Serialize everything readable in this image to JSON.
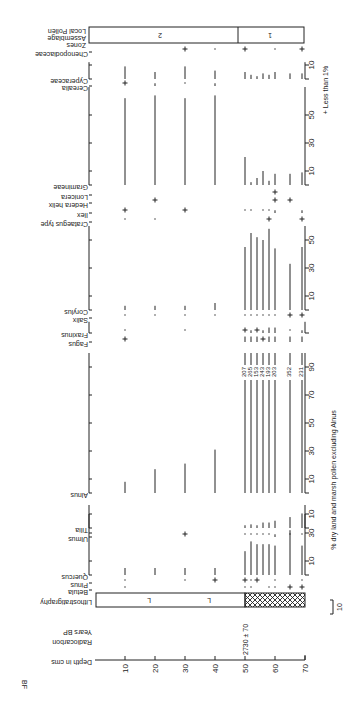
{
  "figure_label": "BF",
  "legend": {
    "plus_note": "+ Less than 1%",
    "scale_bar": "10"
  },
  "x_axis_title": "% dry land and marsh pollen excluding Alnus",
  "depth_axis": {
    "label": "Depth in cms",
    "ticks": [
      10,
      20,
      30,
      40,
      50,
      60,
      70
    ]
  },
  "radiocarbon": {
    "label": "Radiocarbon Years BP",
    "date": "2730 ± 70",
    "depth": 50
  },
  "lithostratigraphy": {
    "label": "Lithostratigraphy",
    "upper_symbol": "L",
    "lower": "hatched"
  },
  "zones": {
    "label": "Local Pollen Assemblage Zones",
    "items": [
      {
        "name": "2",
        "from": 0,
        "to": 50
      },
      {
        "name": "1",
        "from": 50,
        "to": 70
      }
    ]
  },
  "alnus_totals": [
    "207",
    "265",
    "153",
    "243",
    "193",
    "203",
    "352",
    "231"
  ],
  "chart_data": {
    "type": "bar",
    "xlabel": "Depth in cms",
    "ylabel": "% dry land and marsh pollen excluding Alnus",
    "depths": [
      10,
      20,
      30,
      40,
      50,
      52,
      54,
      56,
      58,
      60,
      65,
      69
    ],
    "series": [
      {
        "name": "Betula",
        "values": [
          "·",
          "",
          "",
          "",
          "·",
          "·",
          "",
          "",
          "·",
          "·",
          "+",
          "+"
        ]
      },
      {
        "name": "Pinus",
        "values": [
          "·",
          "",
          "·",
          "+",
          "+",
          "·",
          "+",
          "",
          "",
          "·",
          "",
          "·"
        ]
      },
      {
        "name": "Quercus",
        "values": [
          5,
          5,
          5,
          5,
          17,
          24,
          22,
          22,
          22,
          21,
          32,
          21
        ]
      },
      {
        "name": "Ulmus",
        "values": [
          "",
          "",
          "+",
          "",
          "·",
          "·",
          "·",
          "·",
          "·",
          "1",
          "·",
          "·"
        ]
      },
      {
        "name": "Tilia",
        "values": [
          "",
          "",
          "",
          "",
          "1",
          "2",
          "1",
          "3",
          "3",
          "4",
          "6",
          "8"
        ]
      },
      {
        "name": "Alnus",
        "values": [
          8,
          17,
          21,
          31,
          100,
          100,
          100,
          100,
          100,
          100,
          100,
          100
        ]
      },
      {
        "name": "Fagus",
        "values": [
          "+",
          "",
          "",
          "",
          "3",
          "3",
          "3",
          "+",
          "3",
          "3",
          "3",
          "3"
        ]
      },
      {
        "name": "Fraxinus",
        "values": [
          "·",
          "",
          "·",
          "",
          "+",
          "1",
          "+",
          "1",
          "3",
          "3",
          "·",
          "1"
        ]
      },
      {
        "name": "Salix",
        "values": [
          "·",
          "·",
          "·",
          "·",
          "·",
          "·",
          "·",
          "·",
          "·",
          "·",
          "+",
          "+"
        ]
      },
      {
        "name": "Corylus",
        "values": [
          3,
          3,
          3,
          5,
          45,
          55,
          52,
          50,
          58,
          44,
          33,
          45
        ]
      },
      {
        "name": "Crataegus type",
        "values": [
          "·",
          "·",
          "",
          "",
          "",
          "",
          "",
          "",
          "+",
          "",
          "",
          "+"
        ]
      },
      {
        "name": "Ilex",
        "values": [
          "+",
          "",
          "+",
          "",
          "·",
          "·",
          "",
          "·",
          "·",
          "1",
          "",
          "1"
        ]
      },
      {
        "name": "Hedera helix",
        "values": [
          "",
          "+",
          "",
          "",
          "",
          "",
          "",
          "",
          "",
          "+",
          "+",
          ""
        ]
      },
      {
        "name": "Lonicera",
        "values": [
          "",
          "",
          "",
          "",
          "",
          "",
          "",
          "",
          "",
          "+",
          "",
          ""
        ]
      },
      {
        "name": "Gramineae",
        "values": [
          62,
          64,
          62,
          64,
          20,
          2,
          5,
          10,
          3,
          8,
          8,
          9
        ]
      },
      {
        "name": "Cerealia",
        "values": [
          "+",
          "1",
          "·",
          "1",
          "",
          "",
          "",
          "",
          "",
          "",
          "",
          ""
        ]
      },
      {
        "name": "Cyperaceae",
        "values": [
          9,
          5,
          9,
          6,
          5,
          3,
          2,
          4,
          3,
          5,
          4,
          4
        ]
      },
      {
        "name": "Chenopodiaceae",
        "values": [
          "",
          "",
          "+",
          "·",
          "+",
          "",
          "",
          "",
          "",
          "·",
          "",
          "+"
        ]
      }
    ],
    "alnus_totals_labels": [
      207,
      265,
      153,
      243,
      193,
      203,
      352,
      231
    ],
    "grid": false
  }
}
